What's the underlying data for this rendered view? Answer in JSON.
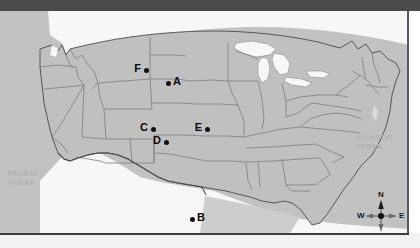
{
  "map": {
    "title": "United States reference map with lettered location points",
    "projection_note": "contiguous United States",
    "colors": {
      "land": "#c0c0c0",
      "water": "#f5f5f5",
      "state_border": "#7d7d7d",
      "national_border": "#4a4a4a",
      "plate_background": "#c2c2c2",
      "top_band": "#4a4a4a",
      "marker": "#0f0f0f",
      "ocean_label": "#b0b0b0"
    },
    "ocean_labels": [
      {
        "id": "pacific-ocean",
        "text": "PACIFIC\nOCEAN"
      },
      {
        "id": "atlantic-ocean",
        "text": "ATLANTIC\nOCEAN"
      }
    ],
    "points": [
      {
        "id": "A",
        "label": "A",
        "label_side": "right",
        "x": 168,
        "y": 72,
        "approx_region": "Nebraska / South Dakota border area"
      },
      {
        "id": "B",
        "label": "B",
        "label_side": "right",
        "x": 192,
        "y": 208,
        "approx_region": "central Texas"
      },
      {
        "id": "C",
        "label": "C",
        "label_side": "left",
        "x": 153,
        "y": 118,
        "approx_region": "Colorado"
      },
      {
        "id": "D",
        "label": "D",
        "label_side": "left",
        "x": 166,
        "y": 131,
        "approx_region": "southeastern Colorado"
      },
      {
        "id": "E",
        "label": "E",
        "label_side": "left",
        "x": 207,
        "y": 118,
        "approx_region": "Kansas"
      },
      {
        "id": "F",
        "label": "F",
        "label_side": "left",
        "x": 146,
        "y": 59,
        "approx_region": "Montana / Wyoming border area"
      }
    ],
    "compass": {
      "north": "N",
      "south": "S",
      "west": "W",
      "east": "E"
    }
  }
}
